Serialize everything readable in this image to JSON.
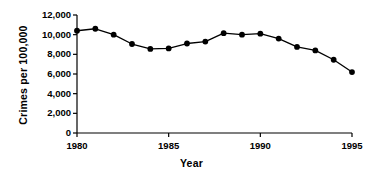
{
  "chart_data": {
    "type": "line",
    "title": "",
    "xlabel": "Year",
    "ylabel": "Crimes per 100,000",
    "x": [
      1980,
      1981,
      1982,
      1983,
      1984,
      1985,
      1986,
      1987,
      1988,
      1989,
      1990,
      1991,
      1992,
      1993,
      1994,
      1995
    ],
    "values": [
      10400,
      10600,
      10000,
      9050,
      8550,
      8600,
      9100,
      9300,
      10150,
      10000,
      10100,
      9600,
      8750,
      8400,
      7450,
      6200
    ],
    "series": [
      {
        "name": "Crimes per 100,000",
        "values": [
          10400,
          10600,
          10000,
          9050,
          8550,
          8600,
          9100,
          9300,
          10150,
          10000,
          10100,
          9600,
          8750,
          8400,
          7450,
          6200
        ]
      }
    ],
    "xlim": [
      1980,
      1995
    ],
    "ylim": [
      0,
      12000
    ],
    "ytick_values": [
      0,
      2000,
      4000,
      6000,
      8000,
      10000,
      12000
    ],
    "ytick_labels": [
      "0",
      "2,000",
      "4,000",
      "6,000",
      "8,000",
      "10,000",
      "12,000"
    ],
    "xtick_values": [
      1980,
      1985,
      1990,
      1995
    ],
    "xtick_labels": [
      "1980",
      "1985",
      "1990",
      "1995"
    ],
    "grid": false,
    "legend": "none",
    "marker": "filled-circle",
    "line_color": "#000000",
    "marker_color": "#000000",
    "background_color": "#ffffff"
  }
}
